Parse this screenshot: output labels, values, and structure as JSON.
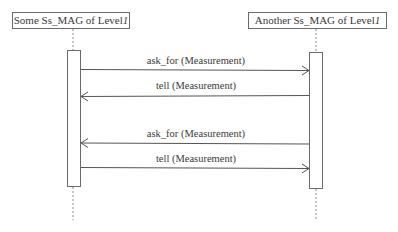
{
  "diagram": {
    "type": "sequence",
    "lifelines": [
      {
        "id": "left",
        "label_prefix": "Some Ss_MAG of Level",
        "label_suffix": "1",
        "x": 73
      },
      {
        "id": "right",
        "label_prefix": "Another Ss_MAG of Level",
        "label_suffix": "1",
        "x": 316
      }
    ],
    "messages": [
      {
        "label": "ask_for (Measurement)",
        "from": "left",
        "to": "right"
      },
      {
        "label": "tell (Measurement)",
        "from": "right",
        "to": "left"
      },
      {
        "label": "ask_for (Measurement)",
        "from": "right",
        "to": "left"
      },
      {
        "label": "tell (Measurement)",
        "from": "left",
        "to": "right"
      }
    ]
  }
}
